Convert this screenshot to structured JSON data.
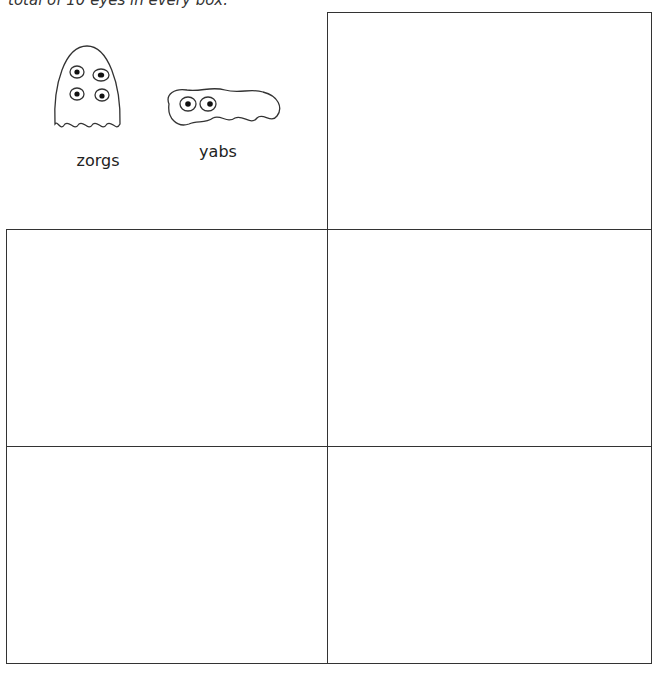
{
  "instruction": {
    "text": "total of 10 eyes in every box."
  },
  "creatures": [
    {
      "name": "zorgs",
      "eyes": 4,
      "icon": "zorg-creature-icon"
    },
    {
      "name": "yabs",
      "eyes": 2,
      "icon": "yab-creature-icon"
    }
  ],
  "grid": {
    "rows": 3,
    "cols": 2,
    "boxes": [
      {
        "row": 0,
        "col": 1,
        "content": ""
      },
      {
        "row": 1,
        "col": 0,
        "content": ""
      },
      {
        "row": 1,
        "col": 1,
        "content": ""
      },
      {
        "row": 2,
        "col": 0,
        "content": ""
      },
      {
        "row": 2,
        "col": 1,
        "content": ""
      }
    ]
  }
}
